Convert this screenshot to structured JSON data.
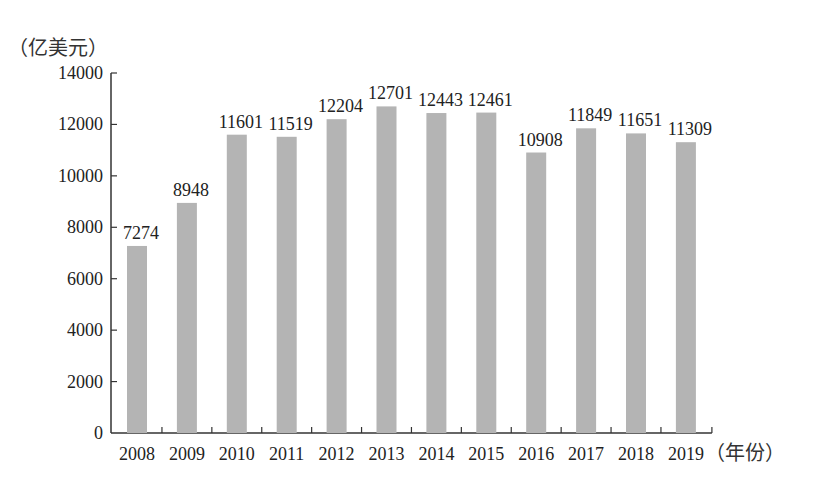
{
  "chart_data": {
    "type": "bar",
    "title": "",
    "ylabel": "（亿美元）",
    "xlabel": "（年份）",
    "categories": [
      "2008",
      "2009",
      "2010",
      "2011",
      "2012",
      "2013",
      "2014",
      "2015",
      "2016",
      "2017",
      "2018",
      "2019"
    ],
    "values": [
      7274,
      8948,
      11601,
      11519,
      12204,
      12701,
      12443,
      12461,
      10908,
      11849,
      11651,
      11309
    ],
    "data_labels": [
      "7274",
      "8948",
      "11601",
      "11519",
      "12204",
      "12701",
      "12443",
      "12461",
      "10908",
      "11849",
      "11651",
      "11309"
    ],
    "ylim": [
      0,
      14000
    ],
    "yticks": [
      0,
      2000,
      4000,
      6000,
      8000,
      10000,
      12000,
      14000
    ],
    "ytick_labels": [
      "0",
      "2000",
      "4000",
      "6000",
      "8000",
      "10000",
      "12000",
      "14000"
    ],
    "grid": false,
    "legend": "none",
    "bar_color": "#b4b4b4"
  }
}
